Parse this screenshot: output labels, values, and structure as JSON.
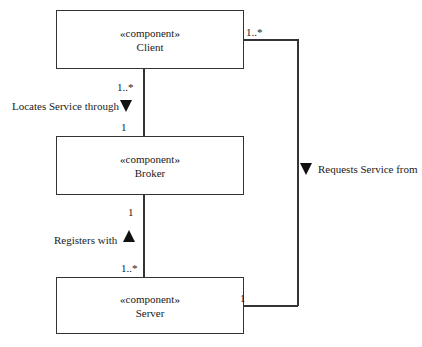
{
  "components": [
    {
      "stereotype": "«component»",
      "name": "Client"
    },
    {
      "stereotype": "«component»",
      "name": "Broker"
    },
    {
      "stereotype": "«component»",
      "name": "Server"
    }
  ],
  "associations": {
    "client_broker": {
      "label": "Locates Service through",
      "client_mult": "1..*",
      "broker_mult": "1",
      "direction": "down"
    },
    "broker_server": {
      "label": "Registers with",
      "broker_mult": "1",
      "server_mult": "1..*",
      "direction": "up"
    },
    "client_server": {
      "label": "Requests Service from",
      "client_mult": "1..*",
      "server_mult": "1",
      "direction": "down"
    }
  }
}
